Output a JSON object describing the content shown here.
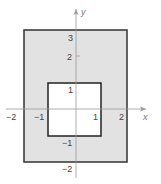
{
  "diagram": {
    "type": "coordinate-region",
    "axes": {
      "x_label": "x",
      "y_label": "y"
    },
    "outer_rect": {
      "x_min": -2,
      "x_max": 2,
      "y_min": -2,
      "y_max": 3,
      "fill": "#e2e2e2",
      "stroke": "#333333"
    },
    "inner_rect": {
      "x_min": -1,
      "x_max": 1,
      "y_min": -1,
      "y_max": 1,
      "fill": "#ffffff",
      "stroke": "#222222"
    },
    "x_ticks": [
      "−2",
      "−1",
      "1",
      "2"
    ],
    "y_ticks": [
      "3",
      "2",
      "1",
      "−1",
      "−2"
    ]
  }
}
